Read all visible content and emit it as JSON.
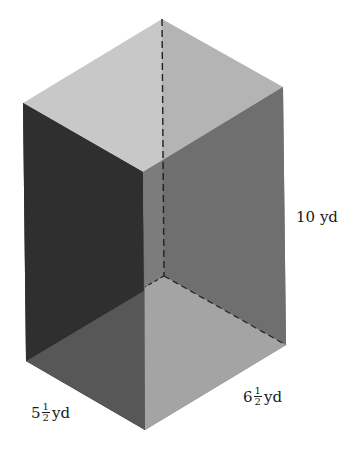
{
  "figure": {
    "type": "rectangular-prism",
    "colors": {
      "top_face": "#c6c6c6",
      "back_right_face": "#a9a9a9",
      "left_front_face": "#2f2f2f",
      "right_front_face": "#7a7a7a",
      "bottom_left_region": "#585858",
      "bottom_right_region": "#a3a3a3",
      "back_left_lower": "#3a3a3a",
      "back_right_lower": "#6e6e6e",
      "hidden_edge": "#222222"
    }
  },
  "labels": {
    "height": {
      "whole": "10",
      "unit": "yd"
    },
    "depth": {
      "whole": "5",
      "num": "1",
      "den": "2",
      "unit": "yd"
    },
    "width": {
      "whole": "6",
      "num": "1",
      "den": "2",
      "unit": "yd"
    }
  }
}
